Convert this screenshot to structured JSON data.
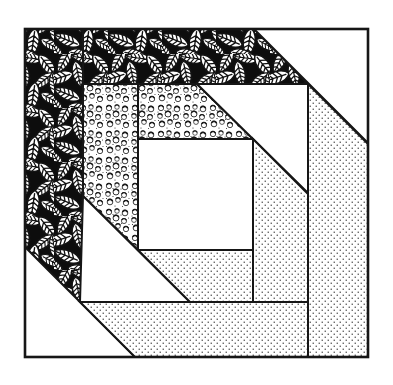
{
  "figure": {
    "figure_type": "quilt-block-illustration",
    "canvas": {
      "width": 393,
      "height": 385
    },
    "colors": {
      "ink": "#161616",
      "paper": "#ffffff",
      "stipple_dot": "#4d4d4d"
    },
    "border": {
      "x": 25,
      "y": 29,
      "width": 343,
      "height": 328
    },
    "textures": [
      "leaves",
      "pebbles",
      "stipple",
      "white"
    ],
    "regions": [
      {
        "name": "leaf-left-log",
        "fill": "leaves",
        "points": "25,29 83,29 83,305 25,247"
      },
      {
        "name": "leaf-top-log",
        "fill": "leaves",
        "points": "83,29 254,29 308,84 83,84"
      },
      {
        "name": "pebble-left-log",
        "fill": "pebbles",
        "points": "83,84 138,84 138,250 83,196"
      },
      {
        "name": "pebble-top-log",
        "fill": "pebbles",
        "points": "138,84 197,84 253,139 138,139"
      },
      {
        "name": "white-triangle-top-right",
        "fill": "white",
        "points": "254,29 368,29 368,143"
      },
      {
        "name": "white-triangle-mid-right",
        "fill": "white",
        "points": "197,84 308,84 308,193"
      },
      {
        "name": "white-triangle-mid-left",
        "fill": "white",
        "points": "83,196 190,302 80,302"
      },
      {
        "name": "white-triangle-bottom-left",
        "fill": "white",
        "points": "25,247 135,357 25,357"
      },
      {
        "name": "dot-right-outer-log",
        "fill": "stipple",
        "points": "308,84 368,144 368,357 308,357"
      },
      {
        "name": "dot-bottom-outer-log",
        "fill": "stipple",
        "points": "80,302 308,302 308,357 135,357"
      },
      {
        "name": "dot-right-inner-log",
        "fill": "stipple",
        "points": "253,139 308,194 308,302 253,302"
      },
      {
        "name": "dot-bottom-inner-log",
        "fill": "stipple",
        "points": "138,250 253,250 253,302 190,302"
      },
      {
        "name": "center-white-square",
        "fill": "white",
        "points": "138,139 253,139 253,250 138,250"
      }
    ]
  }
}
